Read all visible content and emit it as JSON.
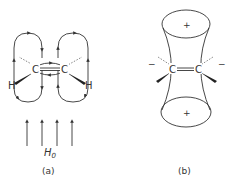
{
  "figure": {
    "panel_a": {
      "caption": "(a)",
      "field_label": "H",
      "field_subscript": "0",
      "atoms": {
        "carbon_left": "C",
        "carbon_right": "C",
        "hydrogen_left": "H",
        "hydrogen_right": "H"
      },
      "field_arrow_count": 4
    },
    "panel_b": {
      "caption": "(b)",
      "atoms": {
        "carbon_left": "C",
        "carbon_right": "C"
      },
      "cone_top_sign": "+",
      "cone_bottom_sign": "+",
      "left_sign": "−",
      "right_sign": "−"
    }
  }
}
